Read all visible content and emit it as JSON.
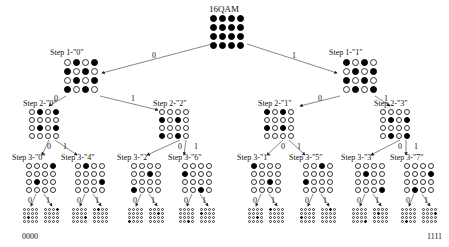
{
  "title": "16QAM",
  "root_grid": "1111111111111111",
  "level1": [
    {
      "label": "Step 1-\"0\"",
      "grid": "0101101001011010"
    },
    {
      "label": "Step 1-\"1\"",
      "grid": "1010010110100101"
    }
  ],
  "level2": [
    {
      "label": "Step 2-\"0\"",
      "grid": "0101000001010000"
    },
    {
      "label": "Step 2-\"2\"",
      "grid": "0000101000001010"
    },
    {
      "label": "Step 2-\"1\"",
      "grid": "1010000010100000"
    },
    {
      "label": "Step 2-\"3\"",
      "grid": "0000010100000101"
    }
  ],
  "level3": [
    {
      "label": "Step 3-\"0\"",
      "grid": "0001000001000000"
    },
    {
      "label": "Step 3-\"4\"",
      "grid": "0100000000010000"
    },
    {
      "label": "Step 3-\"2\"",
      "grid": "0000001000001000"
    },
    {
      "label": "Step 3-\"6\"",
      "grid": "0000100000000010"
    },
    {
      "label": "Step 3-\"1\"",
      "grid": "1000000000100000"
    },
    {
      "label": "Step 3-\"5\"",
      "grid": "0010000010000000"
    },
    {
      "label": "Step 3-\"3\"",
      "grid": "0000010000000001"
    },
    {
      "label": "Step 3-\"7\"",
      "grid": "0000000100000100"
    }
  ],
  "leaves": [
    "0000000001000000",
    "0001000000000000",
    "0000000000010000",
    "0100000000000000",
    "0000000000001000",
    "0000001000000000",
    "0000000000000010",
    "0000100000000000",
    "0000000000100000",
    "1000000000000000",
    "0000000010000000",
    "0010000000000000",
    "0000000000000001",
    "0000010000000000",
    "0000000000000100",
    "0000000100000000"
  ],
  "edge_labels": {
    "zero": "0",
    "one": "1"
  },
  "leaf_codes": {
    "first": "0000",
    "last": "1111"
  }
}
